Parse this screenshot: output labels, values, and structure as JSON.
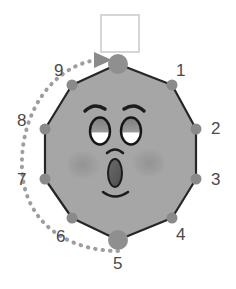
{
  "canvas": {
    "width": 236,
    "height": 289,
    "background": "#ffffff"
  },
  "colors": {
    "body_fill": "#a6a6a6",
    "body_stroke": "#2b2b2b",
    "node_fill": "#8a8a8a",
    "node_big_fill": "#8f8f8f",
    "label_text": "#4a4a4a",
    "dotted_arc": "#9a9a9a",
    "arrow_fill": "#8a8a8a",
    "square_fill": "#ffffff",
    "square_stroke": "#d4d4d4",
    "cheek_fill": "#949494",
    "eye_white": "#ffffff",
    "eye_outline": "#1c1c1c",
    "pupil_fill": "#8d8d8d",
    "mouth_fill": "#5a5a5a",
    "brow_stroke": "#1c1c1c"
  },
  "shape": {
    "name": "decagon-face",
    "sides": 10,
    "center": {
      "x": 118,
      "y": 155
    },
    "radius": 95
  },
  "square": {
    "name": "white-square",
    "x": 101,
    "y": 15,
    "width": 38,
    "height": 37
  },
  "nodes": [
    {
      "id": "node-top",
      "label": "",
      "cx": 118,
      "cy": 64,
      "r": 10,
      "size": "large"
    },
    {
      "id": "node-1",
      "label": "1",
      "cx": 172,
      "cy": 85,
      "r": 5,
      "size": "small"
    },
    {
      "id": "node-2",
      "label": "2",
      "cx": 196,
      "cy": 129,
      "r": 5,
      "size": "small"
    },
    {
      "id": "node-3",
      "label": "3",
      "cx": 196,
      "cy": 179,
      "r": 5,
      "size": "small"
    },
    {
      "id": "node-4",
      "label": "4",
      "cx": 172,
      "cy": 218,
      "r": 5,
      "size": "small"
    },
    {
      "id": "node-5",
      "label": "5",
      "cx": 118,
      "cy": 240,
      "r": 10,
      "size": "large"
    },
    {
      "id": "node-6",
      "label": "6",
      "cx": 72,
      "cy": 218,
      "r": 5,
      "size": "small"
    },
    {
      "id": "node-7",
      "label": "7",
      "cx": 45,
      "cy": 179,
      "r": 5,
      "size": "small"
    },
    {
      "id": "node-8",
      "label": "8",
      "cx": 45,
      "cy": 129,
      "r": 5,
      "size": "small"
    },
    {
      "id": "node-9",
      "label": "9",
      "cx": 72,
      "cy": 85,
      "r": 5,
      "size": "small"
    }
  ],
  "labels": [
    {
      "text": "1",
      "x": 176,
      "y": 62
    },
    {
      "text": "2",
      "x": 211,
      "y": 120
    },
    {
      "text": "3",
      "x": 211,
      "y": 171
    },
    {
      "text": "4",
      "x": 176,
      "y": 226
    },
    {
      "text": "5",
      "x": 113,
      "y": 262
    },
    {
      "text": "6",
      "x": 56,
      "y": 230
    },
    {
      "text": "7",
      "x": 17,
      "y": 171
    },
    {
      "text": "8",
      "x": 17,
      "y": 112
    },
    {
      "text": "9",
      "x": 54,
      "y": 63
    }
  ],
  "arc": {
    "name": "rotation-arrow",
    "style": "dotted",
    "direction": "counterclockwise-to-top",
    "start": {
      "x": 118,
      "y": 250
    },
    "end": {
      "x": 104,
      "y": 60
    },
    "arrowhead": {
      "x": 106,
      "y": 60,
      "points": "96,53 110,60 96,67"
    }
  },
  "face": {
    "left_eye": {
      "cx": 99,
      "cy": 130,
      "rx": 10,
      "ry": 13
    },
    "right_eye": {
      "cx": 130,
      "cy": 130,
      "rx": 10,
      "ry": 13
    },
    "left_brow": {
      "path": "M 85 110 Q 94 103 104 109"
    },
    "right_brow": {
      "path": "M 124 109 Q 134 103 143 110"
    },
    "nose": {
      "path": "M 107 152 Q 114 146 121 152"
    },
    "mouth": {
      "cx": 115,
      "cy": 172,
      "rx": 7,
      "ry": 14
    },
    "chin": {
      "path": "M 103 192 Q 115 200 127 192"
    },
    "left_cheek": {
      "cx": 83,
      "cy": 165,
      "rx": 18,
      "ry": 15
    },
    "right_cheek": {
      "cx": 149,
      "cy": 163,
      "rx": 18,
      "ry": 15
    }
  }
}
